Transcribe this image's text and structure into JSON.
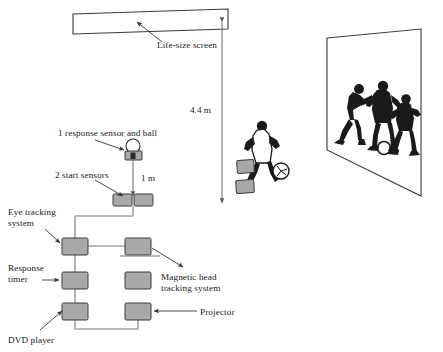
{
  "figure": {
    "background_color": "#ffffff",
    "width": 443,
    "height": 352
  },
  "labels": {
    "life_size_screen": "Life-size screen",
    "response_sensor": "1 response sensor and ball",
    "start_sensors": "2 start sensors",
    "eye_tracking_line1": "Eye tracking",
    "eye_tracking_line2": "system",
    "response_timer_line1": "Response",
    "response_timer_line2": "timer",
    "dvd_player": "DVD player",
    "magnetic_head_line1": "Magnetic head",
    "magnetic_head_line2": "tracking system",
    "projector": "Projector"
  },
  "dimensions": {
    "vertical_distance": "4.4 m",
    "sensor_distance": "1 m"
  },
  "colors": {
    "equipment_fill": "#a8a8a8",
    "equipment_stroke": "#3a3a3a",
    "line": "#555555",
    "text": "#1a1a1a",
    "screen_stroke": "#3a3a3a",
    "figure_dark": "#1a1a1a"
  },
  "equipment": [
    {
      "id": "eye-tracking-system",
      "x": 62,
      "y": 238,
      "w": 26,
      "h": 17
    },
    {
      "id": "response-timer",
      "x": 62,
      "y": 272,
      "w": 26,
      "h": 17
    },
    {
      "id": "dvd-player",
      "x": 62,
      "y": 303,
      "w": 26,
      "h": 17
    },
    {
      "id": "magnetic-head-tracking-system",
      "x": 125,
      "y": 238,
      "w": 26,
      "h": 17
    },
    {
      "id": "unlabeled-unit",
      "x": 125,
      "y": 272,
      "w": 26,
      "h": 17
    },
    {
      "id": "projector",
      "x": 125,
      "y": 303,
      "w": 26,
      "h": 17
    },
    {
      "id": "start-sensor-left",
      "x": 113,
      "y": 194,
      "w": 19,
      "h": 12
    },
    {
      "id": "start-sensor-right",
      "x": 134,
      "y": 194,
      "w": 19,
      "h": 12
    }
  ]
}
